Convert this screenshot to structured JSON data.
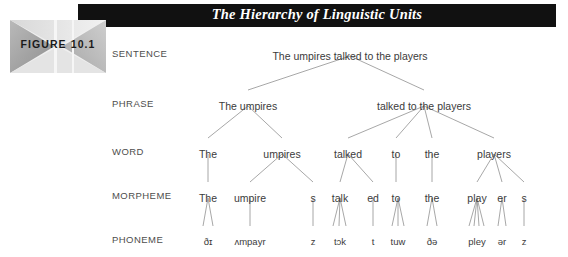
{
  "figure": {
    "badge_label": "FIGURE 10.1",
    "title": "The Hierarchy of Linguistic Units",
    "title_color": "#ffffff",
    "header_color": "#111111",
    "line_color": "#8a8a8a",
    "text_color": "#3b3b3b",
    "label_color": "#4d4d4d"
  },
  "rows": [
    {
      "label": "SENTENCE"
    },
    {
      "label": "PHRASE"
    },
    {
      "label": "WORD"
    },
    {
      "label": "MORPHEME"
    },
    {
      "label": "PHONEME"
    }
  ],
  "tree": {
    "sentence": [
      {
        "text": "The umpires talked to the players",
        "x": 350,
        "y": 50
      }
    ],
    "phrase": [
      {
        "text": "The umpires",
        "x": 248,
        "y": 100
      },
      {
        "text": "talked to the players",
        "x": 424,
        "y": 100
      }
    ],
    "word": [
      {
        "text": "The",
        "x": 208,
        "y": 148
      },
      {
        "text": "umpires",
        "x": 282,
        "y": 148
      },
      {
        "text": "talked",
        "x": 348,
        "y": 148
      },
      {
        "text": "to",
        "x": 396,
        "y": 148
      },
      {
        "text": "the",
        "x": 432,
        "y": 148
      },
      {
        "text": "players",
        "x": 494,
        "y": 148
      }
    ],
    "morpheme": [
      {
        "text": "The",
        "x": 208,
        "y": 192
      },
      {
        "text": "umpire",
        "x": 250,
        "y": 192
      },
      {
        "text": "s",
        "x": 313,
        "y": 192
      },
      {
        "text": "talk",
        "x": 340,
        "y": 192
      },
      {
        "text": "ed",
        "x": 373,
        "y": 192
      },
      {
        "text": "to",
        "x": 396,
        "y": 192
      },
      {
        "text": "the",
        "x": 432,
        "y": 192
      },
      {
        "text": "play",
        "x": 477,
        "y": 192
      },
      {
        "text": "er",
        "x": 502,
        "y": 192
      },
      {
        "text": "s",
        "x": 524,
        "y": 192
      }
    ],
    "phoneme": [
      {
        "text": "ðɪ",
        "x": 208,
        "y": 236
      },
      {
        "text": "ʌmpayr",
        "x": 250,
        "y": 236
      },
      {
        "text": "z",
        "x": 313,
        "y": 236
      },
      {
        "text": "tɔk",
        "x": 340,
        "y": 236
      },
      {
        "text": "t",
        "x": 373,
        "y": 236
      },
      {
        "text": "tuw",
        "x": 398,
        "y": 236
      },
      {
        "text": "ðə",
        "x": 432,
        "y": 236
      },
      {
        "text": "pley",
        "x": 477,
        "y": 236
      },
      {
        "text": "ər",
        "x": 502,
        "y": 236
      },
      {
        "text": "z",
        "x": 524,
        "y": 236
      }
    ]
  },
  "edges": [
    {
      "x1": 350,
      "y1": 56,
      "x2": 248,
      "y2": 90
    },
    {
      "x1": 350,
      "y1": 56,
      "x2": 424,
      "y2": 90
    },
    {
      "x1": 248,
      "y1": 106,
      "x2": 208,
      "y2": 138
    },
    {
      "x1": 248,
      "y1": 106,
      "x2": 282,
      "y2": 138
    },
    {
      "x1": 424,
      "y1": 106,
      "x2": 348,
      "y2": 138
    },
    {
      "x1": 424,
      "y1": 106,
      "x2": 396,
      "y2": 138
    },
    {
      "x1": 424,
      "y1": 106,
      "x2": 432,
      "y2": 138
    },
    {
      "x1": 424,
      "y1": 106,
      "x2": 494,
      "y2": 138
    },
    {
      "x1": 208,
      "y1": 154,
      "x2": 208,
      "y2": 182
    },
    {
      "x1": 282,
      "y1": 154,
      "x2": 250,
      "y2": 182
    },
    {
      "x1": 282,
      "y1": 154,
      "x2": 313,
      "y2": 182
    },
    {
      "x1": 348,
      "y1": 154,
      "x2": 340,
      "y2": 182
    },
    {
      "x1": 348,
      "y1": 154,
      "x2": 373,
      "y2": 182
    },
    {
      "x1": 396,
      "y1": 154,
      "x2": 396,
      "y2": 182
    },
    {
      "x1": 432,
      "y1": 154,
      "x2": 432,
      "y2": 182
    },
    {
      "x1": 494,
      "y1": 154,
      "x2": 477,
      "y2": 182
    },
    {
      "x1": 494,
      "y1": 154,
      "x2": 502,
      "y2": 182
    },
    {
      "x1": 494,
      "y1": 154,
      "x2": 524,
      "y2": 182
    },
    {
      "x1": 208,
      "y1": 198,
      "x2": 203,
      "y2": 226
    },
    {
      "x1": 208,
      "y1": 198,
      "x2": 213,
      "y2": 226
    },
    {
      "x1": 250,
      "y1": 198,
      "x2": 250,
      "y2": 226
    },
    {
      "x1": 313,
      "y1": 198,
      "x2": 313,
      "y2": 226
    },
    {
      "x1": 340,
      "y1": 198,
      "x2": 333,
      "y2": 226
    },
    {
      "x1": 340,
      "y1": 198,
      "x2": 339,
      "y2": 226
    },
    {
      "x1": 340,
      "y1": 198,
      "x2": 346,
      "y2": 226
    },
    {
      "x1": 373,
      "y1": 198,
      "x2": 373,
      "y2": 226
    },
    {
      "x1": 398,
      "y1": 198,
      "x2": 392,
      "y2": 226
    },
    {
      "x1": 398,
      "y1": 198,
      "x2": 398,
      "y2": 226
    },
    {
      "x1": 398,
      "y1": 198,
      "x2": 404,
      "y2": 226
    },
    {
      "x1": 432,
      "y1": 198,
      "x2": 427,
      "y2": 226
    },
    {
      "x1": 432,
      "y1": 198,
      "x2": 437,
      "y2": 226
    },
    {
      "x1": 477,
      "y1": 198,
      "x2": 469,
      "y2": 226
    },
    {
      "x1": 477,
      "y1": 198,
      "x2": 474,
      "y2": 226
    },
    {
      "x1": 477,
      "y1": 198,
      "x2": 479,
      "y2": 226
    },
    {
      "x1": 477,
      "y1": 198,
      "x2": 484,
      "y2": 226
    },
    {
      "x1": 502,
      "y1": 198,
      "x2": 498,
      "y2": 226
    },
    {
      "x1": 502,
      "y1": 198,
      "x2": 506,
      "y2": 226
    },
    {
      "x1": 524,
      "y1": 198,
      "x2": 524,
      "y2": 226
    }
  ],
  "row_label_positions": [
    {
      "x": 112,
      "y": 48
    },
    {
      "x": 112,
      "y": 98
    },
    {
      "x": 112,
      "y": 146
    },
    {
      "x": 112,
      "y": 190
    },
    {
      "x": 112,
      "y": 234
    }
  ]
}
